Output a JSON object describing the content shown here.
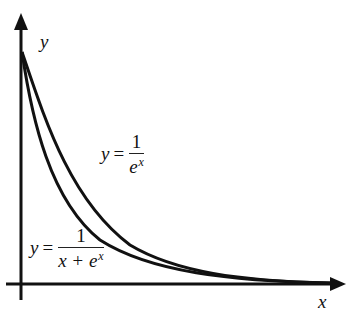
{
  "figure": {
    "axes": {
      "x_label": "x",
      "y_label": "y"
    },
    "labels": {
      "curve_exp": {
        "lhs": "y",
        "eq": "=",
        "numerator": "1",
        "denominator_base": "e",
        "denominator_exp": "x"
      },
      "curve_sum": {
        "lhs": "y",
        "eq": "=",
        "numerator": "1",
        "denominator_base": "x + e",
        "denominator_exp": "x"
      }
    },
    "colors": {
      "stroke": "#111111",
      "background": "#ffffff"
    }
  }
}
